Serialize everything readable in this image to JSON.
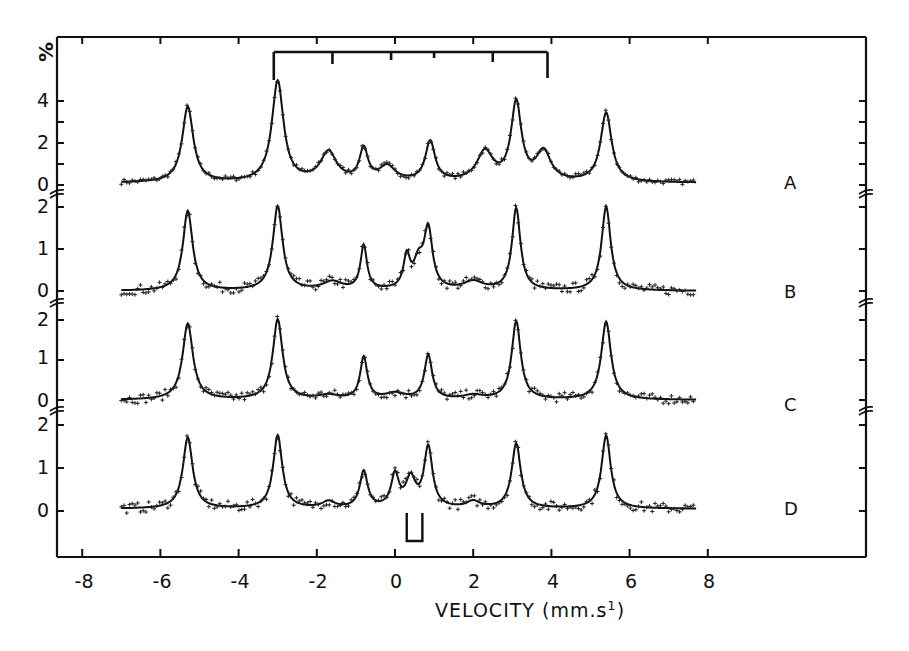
{
  "chart_data": {
    "type": "line",
    "title": "",
    "xlabel": "VELOCITY (mm.s⁻¹)",
    "ylabel": "%",
    "xlim": [
      -8.8,
      12
    ],
    "x_ticks": [
      -8,
      -6,
      -4,
      -2,
      0,
      2,
      4,
      6,
      8
    ],
    "grid": false,
    "legend": "none (series labelled A-D on the right)",
    "stick_diagram_top": {
      "description": "sextet line positions bracket above spectrum A",
      "x": [
        -3.1,
        -1.6,
        -0.1,
        1.0,
        2.5,
        3.9
      ]
    },
    "doublet_marker_bottom": {
      "description": "doublet bracket under spectrum D",
      "x": [
        0.3,
        0.7
      ]
    },
    "series": [
      {
        "name": "A",
        "y_ticks": [
          0,
          2,
          4
        ],
        "ylim": [
          0,
          5.5
        ],
        "peaks": [
          {
            "x": -5.3,
            "y": 3.7
          },
          {
            "x": -3.0,
            "y": 4.9
          },
          {
            "x": -1.7,
            "y": 1.5
          },
          {
            "x": -0.8,
            "y": 1.6
          },
          {
            "x": -0.2,
            "y": 0.8
          },
          {
            "x": 0.9,
            "y": 2.0
          },
          {
            "x": 2.3,
            "y": 1.5
          },
          {
            "x": 3.1,
            "y": 3.8
          },
          {
            "x": 3.8,
            "y": 1.5
          },
          {
            "x": 5.4,
            "y": 3.4
          }
        ],
        "baseline": 0.1
      },
      {
        "name": "B",
        "y_ticks": [
          0,
          1,
          2
        ],
        "ylim": [
          0,
          2.2
        ],
        "peaks": [
          {
            "x": -5.3,
            "y": 1.9
          },
          {
            "x": -3.0,
            "y": 2.0
          },
          {
            "x": -1.6,
            "y": 0.2
          },
          {
            "x": -0.8,
            "y": 1.05
          },
          {
            "x": 0.3,
            "y": 0.75
          },
          {
            "x": 0.6,
            "y": 0.6
          },
          {
            "x": 0.85,
            "y": 1.4
          },
          {
            "x": 2.0,
            "y": 0.2
          },
          {
            "x": 3.1,
            "y": 1.95
          },
          {
            "x": 5.4,
            "y": 2.0
          }
        ],
        "baseline": 0.0
      },
      {
        "name": "C",
        "y_ticks": [
          0,
          1,
          2
        ],
        "ylim": [
          0,
          2.2
        ],
        "peaks": [
          {
            "x": -5.3,
            "y": 1.9
          },
          {
            "x": -3.0,
            "y": 2.0
          },
          {
            "x": -1.7,
            "y": 0.1
          },
          {
            "x": -0.8,
            "y": 1.05
          },
          {
            "x": 0.0,
            "y": 0.15
          },
          {
            "x": 0.85,
            "y": 1.1
          },
          {
            "x": 2.0,
            "y": 0.1
          },
          {
            "x": 3.1,
            "y": 1.95
          },
          {
            "x": 5.4,
            "y": 1.95
          }
        ],
        "baseline": 0.0
      },
      {
        "name": "D",
        "y_ticks": [
          0,
          1,
          2
        ],
        "ylim": [
          0,
          2.2
        ],
        "peaks": [
          {
            "x": -5.3,
            "y": 1.7
          },
          {
            "x": -3.0,
            "y": 1.75
          },
          {
            "x": -1.7,
            "y": 0.2
          },
          {
            "x": -0.8,
            "y": 0.9
          },
          {
            "x": 0.0,
            "y": 0.8
          },
          {
            "x": 0.4,
            "y": 0.7
          },
          {
            "x": 0.85,
            "y": 1.45
          },
          {
            "x": 2.0,
            "y": 0.2
          },
          {
            "x": 3.1,
            "y": 1.55
          },
          {
            "x": 5.4,
            "y": 1.75
          }
        ],
        "baseline": 0.05
      }
    ]
  },
  "axes": {
    "y_unit": "%",
    "x_label": "VELOCITY (mm.s",
    "x_label_exp": "1",
    "x_label_close": ")",
    "x_ticks": [
      "-8",
      "-6",
      "-4",
      "-2",
      "0",
      "2",
      "4",
      "6",
      "8"
    ],
    "y_labels_A": [
      "0",
      "2",
      "4"
    ],
    "y_labels_B": [
      "0",
      "1",
      "2"
    ],
    "y_labels_C": [
      "0",
      "1",
      "2"
    ],
    "y_labels_D": [
      "0",
      "1",
      "2"
    ]
  },
  "series_labels": [
    "A",
    "B",
    "C",
    "D"
  ]
}
